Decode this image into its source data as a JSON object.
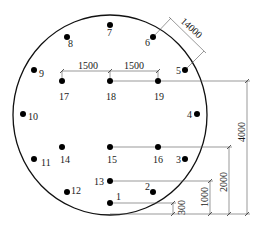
{
  "diagram": {
    "type": "borehole-layout-plan",
    "boundary": {
      "shape": "circle",
      "cx": 110,
      "cy": 115,
      "rx": 97,
      "ry": 100,
      "stroke": "#111111"
    },
    "points": [
      {
        "id": "1",
        "label": "1",
        "x": 110,
        "y": 203,
        "lx": 116,
        "ly": 200
      },
      {
        "id": "2",
        "label": "2",
        "x": 153,
        "y": 192,
        "lx": 145,
        "ly": 190
      },
      {
        "id": "3",
        "label": "3",
        "x": 185,
        "y": 159,
        "lx": 176,
        "ly": 163
      },
      {
        "id": "4",
        "label": "4",
        "x": 197,
        "y": 114,
        "lx": 187,
        "ly": 118
      },
      {
        "id": "5",
        "label": "5",
        "x": 185,
        "y": 70,
        "lx": 176,
        "ly": 74
      },
      {
        "id": "6",
        "label": "6",
        "x": 153,
        "y": 37,
        "lx": 145,
        "ly": 46
      },
      {
        "id": "7",
        "label": "7",
        "x": 110,
        "y": 25,
        "lx": 107,
        "ly": 36
      },
      {
        "id": "8",
        "label": "8",
        "x": 67,
        "y": 37,
        "lx": 68,
        "ly": 47
      },
      {
        "id": "9",
        "label": "9",
        "x": 34,
        "y": 70,
        "lx": 39,
        "ly": 77
      },
      {
        "id": "10",
        "label": "10",
        "x": 23,
        "y": 114,
        "lx": 28,
        "ly": 120
      },
      {
        "id": "11",
        "label": "11",
        "x": 34,
        "y": 159,
        "lx": 41,
        "ly": 166
      },
      {
        "id": "12",
        "label": "12",
        "x": 67,
        "y": 192,
        "lx": 71,
        "ly": 194
      },
      {
        "id": "13",
        "label": "13",
        "x": 110,
        "y": 181,
        "lx": 94,
        "ly": 185
      },
      {
        "id": "14",
        "label": "14",
        "x": 62,
        "y": 147,
        "lx": 60,
        "ly": 163
      },
      {
        "id": "15",
        "label": "15",
        "x": 110,
        "y": 147,
        "lx": 107,
        "ly": 163
      },
      {
        "id": "16",
        "label": "16",
        "x": 158,
        "y": 147,
        "lx": 153,
        "ly": 163
      },
      {
        "id": "17",
        "label": "17",
        "x": 62,
        "y": 81,
        "lx": 59,
        "ly": 100
      },
      {
        "id": "18",
        "label": "18",
        "x": 110,
        "y": 81,
        "lx": 106,
        "ly": 100
      },
      {
        "id": "19",
        "label": "19",
        "x": 158,
        "y": 81,
        "lx": 154,
        "ly": 100
      }
    ],
    "dimensions": {
      "spacing_1": {
        "label": "1500",
        "x1": 62,
        "x2": 110,
        "y": 71,
        "tx": 78,
        "ty": 69
      },
      "spacing_2": {
        "label": "1500",
        "x1": 110,
        "x2": 158,
        "y": 71,
        "tx": 124,
        "ty": 69
      },
      "diagonal": {
        "label": "14000",
        "tx": 188,
        "ty": 28,
        "angle": 42
      },
      "h300": {
        "label": "300",
        "x": 173,
        "top": 203,
        "bottom": 214
      },
      "h1000": {
        "label": "1000",
        "x": 210,
        "top": 181,
        "bottom": 214
      },
      "h2000": {
        "label": "2000",
        "x": 229,
        "top": 147,
        "bottom": 214
      },
      "h4000": {
        "label": "4000",
        "x": 247,
        "top": 81,
        "bottom": 214
      }
    },
    "baseline_y": 214
  }
}
